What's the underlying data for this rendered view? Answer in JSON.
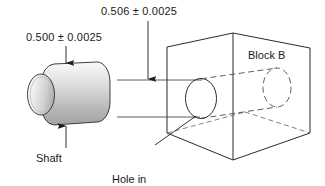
{
  "figure": {
    "type": "engineering-diagram",
    "title_text": null,
    "background_color": "#ffffff",
    "line_color": "#1a1a1a",
    "text_color": "#1a1a1a"
  },
  "labels": {
    "shaft_dimension": "0.500 ± 0.0025",
    "hole_dimension": "0.506 ± 0.0025",
    "shaft_name": "Shaft",
    "hole_name_line1": "Hole in",
    "hole_name_line2": "block",
    "block_name": "Block B"
  },
  "parts": [
    {
      "id": "shaft",
      "name": "Shaft",
      "shape": "cylinder",
      "dimension": "0.500 ± 0.0025",
      "nominal": 0.5,
      "tolerance": 0.0025,
      "fill": "gradient-gray",
      "fill_light": "#fdfdfd",
      "fill_dark": "#9a9a9a"
    },
    {
      "id": "block",
      "name": "Block B",
      "shape": "isometric-box",
      "feature": "through-hole",
      "dimension": "0.506 ± 0.0025",
      "nominal": 0.506,
      "tolerance": 0.0025,
      "fill": "#ffffff"
    }
  ],
  "annotations": [
    {
      "id": "shaft-top-arrow",
      "points_to": "shaft-top-surface",
      "direction": "down"
    },
    {
      "id": "shaft-bottom-arrow",
      "points_to": "shaft-bottom-surface",
      "direction": "up"
    },
    {
      "id": "hole-dim-arrow",
      "points_to": "hole-upper-extension-line",
      "direction": "down"
    },
    {
      "id": "hole-leader",
      "points_to": "hole-front-edge",
      "direction": "up-right"
    }
  ]
}
